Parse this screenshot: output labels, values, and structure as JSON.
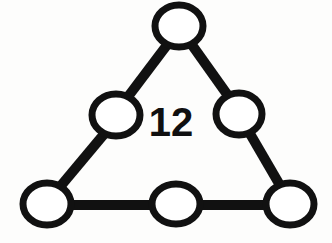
{
  "diagram": {
    "type": "node-edge-triangle",
    "title": "12",
    "background_color": "#fdfdfc",
    "stroke_color": "#111111",
    "node_fill_color": "#ffffff",
    "edge_stroke_width": 10,
    "node_stroke_width": 7,
    "canvas": {
      "width": 332,
      "height": 243
    },
    "center_label": {
      "text": "12",
      "x": 171,
      "y": 122,
      "font_size": 40,
      "font_weight": "bold",
      "color": "#101010"
    },
    "nodes": [
      {
        "id": "apex",
        "name": "top-vertex-node",
        "label": "",
        "cx": 179,
        "cy": 26,
        "rx": 24,
        "ry": 21
      },
      {
        "id": "left-mid",
        "name": "left-edge-midpoint-node",
        "label": "",
        "cx": 116,
        "cy": 115,
        "rx": 24,
        "ry": 21
      },
      {
        "id": "right-mid",
        "name": "right-edge-midpoint-node",
        "label": "",
        "cx": 239,
        "cy": 114,
        "rx": 23,
        "ry": 21
      },
      {
        "id": "bottom-left",
        "name": "bottom-left-vertex-node",
        "label": "",
        "cx": 47,
        "cy": 204,
        "rx": 24,
        "ry": 21
      },
      {
        "id": "bottom-mid",
        "name": "bottom-edge-midpoint-node",
        "label": "",
        "cx": 176,
        "cy": 204,
        "rx": 24,
        "ry": 20
      },
      {
        "id": "bottom-right",
        "name": "bottom-right-vertex-node",
        "label": "",
        "cx": 290,
        "cy": 204,
        "rx": 24,
        "ry": 21
      }
    ],
    "edges": [
      {
        "id": "e1",
        "name": "edge-apex-to-left-mid",
        "from": "apex",
        "to": "left-mid",
        "x1": 167,
        "y1": 45,
        "x2": 127,
        "y2": 98
      },
      {
        "id": "e2",
        "name": "edge-apex-to-right-mid",
        "from": "apex",
        "to": "right-mid",
        "x1": 192,
        "y1": 45,
        "x2": 229,
        "y2": 97
      },
      {
        "id": "e3",
        "name": "edge-left-mid-to-bottom-left",
        "from": "left-mid",
        "to": "bottom-left",
        "x1": 105,
        "y1": 133,
        "x2": 59,
        "y2": 188
      },
      {
        "id": "e4",
        "name": "edge-right-mid-to-bottom-right",
        "from": "right-mid",
        "to": "bottom-right",
        "x1": 249,
        "y1": 132,
        "x2": 281,
        "y2": 187
      },
      {
        "id": "e5",
        "name": "edge-bottom-left-to-bottom-mid",
        "from": "bottom-left",
        "to": "bottom-mid",
        "x1": 66,
        "y1": 205,
        "x2": 157,
        "y2": 205
      },
      {
        "id": "e6",
        "name": "edge-bottom-mid-to-bottom-right",
        "from": "bottom-mid",
        "to": "bottom-right",
        "x1": 195,
        "y1": 205,
        "x2": 272,
        "y2": 205
      }
    ]
  }
}
